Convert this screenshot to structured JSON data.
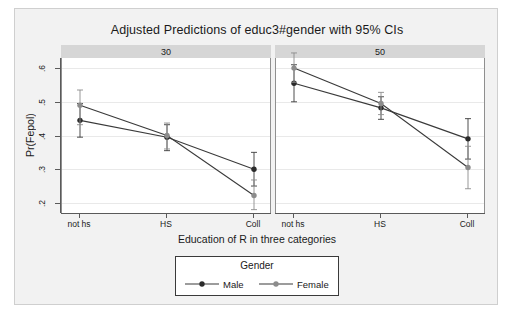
{
  "title": "Adjusted Predictions of educ3#gender with 95% CIs",
  "axis": {
    "xtitle": "Education of R in three categories",
    "ytitle": "Pr(Fepol)",
    "yticks": [
      ".2",
      ".3",
      ".4",
      ".5",
      ".6"
    ],
    "xticklabels": [
      "not hs",
      "HS",
      "Coll"
    ]
  },
  "panels": [
    {
      "label": "30"
    },
    {
      "label": "50"
    }
  ],
  "legend": {
    "title": "Gender",
    "male_label": "Male",
    "female_label": "Female"
  },
  "colors": {
    "male": "#3a3a3a",
    "female": "#8c8c8c",
    "panel_header": "#d6d6d6",
    "figure_bg": "#f2f2f2",
    "plot_bg": "#ffffff",
    "grid": "#e9e9e9",
    "axis": "#5a5a5a"
  },
  "chart_data": {
    "type": "line",
    "title": "Adjusted Predictions of educ3#gender with 95% CIs",
    "xlabel": "Education of R in three categories",
    "ylabel": "Pr(Fepol)",
    "ylim": [
      0.17,
      0.63
    ],
    "yticks": [
      0.2,
      0.3,
      0.4,
      0.5,
      0.6
    ],
    "categories": [
      "not hs",
      "HS",
      "Coll"
    ],
    "grid": true,
    "legend_position": "bottom",
    "panel_variable": "age",
    "panels": [
      {
        "label": "30",
        "series": [
          {
            "name": "Male",
            "values": [
              0.445,
              0.395,
              0.3
            ],
            "ci_lower": [
              0.395,
              0.355,
              0.25
            ],
            "ci_upper": [
              0.495,
              0.432,
              0.35
            ]
          },
          {
            "name": "Female",
            "values": [
              0.49,
              0.4,
              0.222
            ],
            "ci_lower": [
              0.432,
              0.36,
              0.18
            ],
            "ci_upper": [
              0.535,
              0.437,
              0.268
            ]
          }
        ]
      },
      {
        "label": "50",
        "series": [
          {
            "name": "Male",
            "values": [
              0.555,
              0.482,
              0.39
            ],
            "ci_lower": [
              0.5,
              0.448,
              0.33
            ],
            "ci_upper": [
              0.61,
              0.515,
              0.45
            ]
          },
          {
            "name": "Female",
            "values": [
              0.6,
              0.495,
              0.305
            ],
            "ci_lower": [
              0.558,
              0.462,
              0.242
            ],
            "ci_upper": [
              0.645,
              0.528,
              0.368
            ]
          }
        ]
      }
    ]
  }
}
